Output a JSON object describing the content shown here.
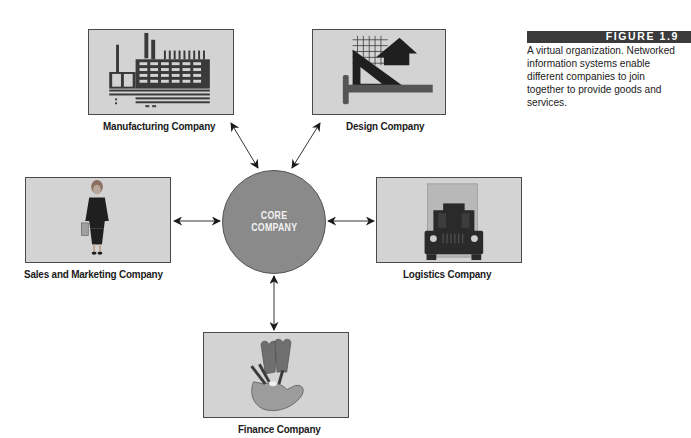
{
  "figure": {
    "number_label": "FIGURE 1.9",
    "caption": "A virtual organization. Networked information systems enable different companies to join together to provide goods and services."
  },
  "diagram": {
    "title": "Virtual organization",
    "center": {
      "line1": "CORE",
      "line2": "COMPANY",
      "fill": "#8a8a8a"
    },
    "nodes": [
      {
        "id": "manufacturing",
        "label": "Manufacturing Company",
        "icon": "factory-icon"
      },
      {
        "id": "design",
        "label": "Design Company",
        "icon": "drafting-tools-icon"
      },
      {
        "id": "sales",
        "label": "Sales and Marketing Company",
        "icon": "businesswoman-icon"
      },
      {
        "id": "logistics",
        "label": "Logistics Company",
        "icon": "truck-icon"
      },
      {
        "id": "finance",
        "label": "Finance Company",
        "icon": "hand-holding-money-icon"
      }
    ],
    "edges": [
      {
        "from": "core",
        "to": "manufacturing",
        "type": "bidirectional"
      },
      {
        "from": "core",
        "to": "design",
        "type": "bidirectional"
      },
      {
        "from": "core",
        "to": "sales",
        "type": "bidirectional"
      },
      {
        "from": "core",
        "to": "logistics",
        "type": "bidirectional"
      },
      {
        "from": "core",
        "to": "finance",
        "type": "bidirectional"
      }
    ],
    "colors": {
      "box_fill": "#d3d3d3",
      "box_border": "#4a4a4a",
      "icon_dark": "#3a3a3a",
      "figure_bar": "#3b3b3b"
    }
  }
}
